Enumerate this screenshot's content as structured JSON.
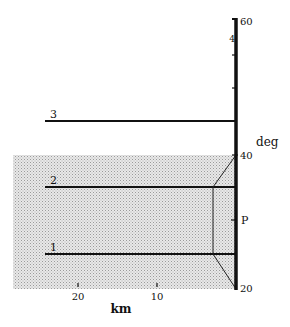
{
  "diagram": {
    "x_axis": {
      "label": "km",
      "ticks": [
        {
          "value": "20",
          "x": 78
        },
        {
          "value": "10",
          "x": 157
        }
      ]
    },
    "y_axis": {
      "label": "deg",
      "ticks": [
        {
          "value": "60",
          "y": 19
        },
        {
          "value": "4",
          "y": 40
        },
        {
          "value": "40",
          "y": 157
        },
        {
          "value": "20",
          "y": 288
        }
      ],
      "marker": {
        "label": "P",
        "y": 220
      }
    },
    "lines": [
      {
        "label": "3",
        "y": 121
      },
      {
        "label": "2",
        "y": 187
      },
      {
        "label": "1",
        "y": 254
      }
    ],
    "shaded_region": {
      "x0": 13,
      "y0": 155,
      "x1": 236,
      "y1": 289
    },
    "colors": {
      "line": "#111111",
      "shade": "#d6d6d6",
      "background": "#ffffff"
    }
  }
}
